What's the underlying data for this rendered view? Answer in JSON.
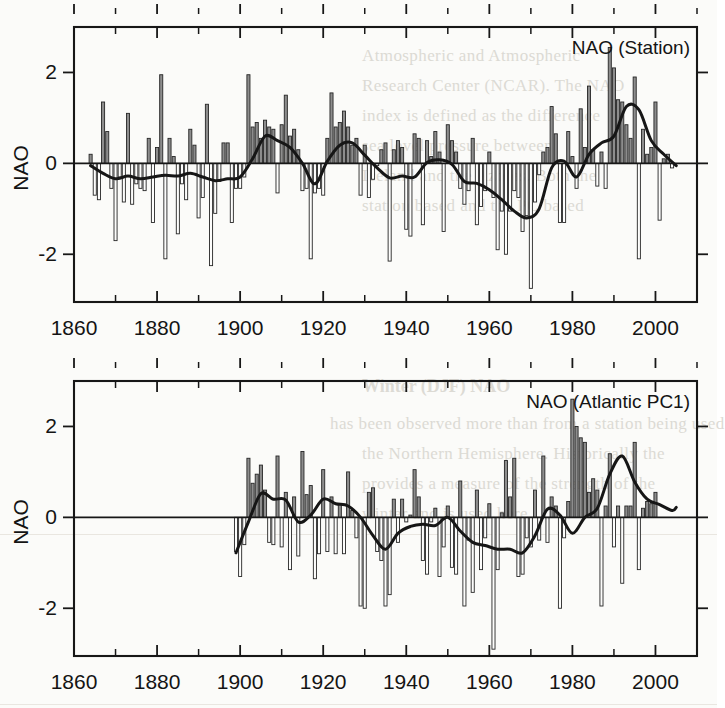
{
  "figure": {
    "background": "#fbfbf9",
    "ink_color": "#171717",
    "bar_positive_fill": "#8d8d8d",
    "bar_negative_fill": "#ffffff",
    "smooth_line_color": "#161616"
  },
  "bleed_text": {
    "note": "faint show-through text from the reverse side of the printed page",
    "top_lines": [
      "Atmospheric  and  Atmospheric",
      "Research  Center  (NCAR).  The  NAO",
      "index  is  defined  as  the  difference",
      "sea  level  pressure  between",
      "Iceland  and  the  Azores.  Both  the",
      "station  based  and  the  PC  based"
    ],
    "section_heading": "Winter  (DJF)  NAO",
    "bottom_lines": [
      "has  been  observed  more  than  from  a  station  being  used",
      "the  Northern  Hemisphere.  Historically  the",
      "provides  a  measure  of  the  strength  of  the",
      "winter  and  is  used  here"
    ]
  },
  "chart_data": [
    {
      "id": "nao-station",
      "type": "bar",
      "title": "NAO (Station)",
      "xlabel": "",
      "ylabel": "NAO",
      "xlim": [
        1860,
        2010
      ],
      "ylim": [
        -3.05,
        3.0
      ],
      "grid": false,
      "legend": null,
      "x_major_ticks": [
        1860,
        1880,
        1900,
        1920,
        1940,
        1960,
        1980,
        2000
      ],
      "x_major_tick_labels": [
        "1860",
        "1880",
        "1900",
        "1920",
        "1940",
        "1960",
        "1980",
        "2000"
      ],
      "x_minor_tick_interval": 10,
      "y_major_ticks": [
        -2,
        0,
        2
      ],
      "y_major_tick_labels": [
        "-2",
        "0",
        "2"
      ],
      "overlay_series_name": "low-pass filtered NAO",
      "x": [
        1864,
        1865,
        1866,
        1867,
        1868,
        1869,
        1870,
        1871,
        1872,
        1873,
        1874,
        1875,
        1876,
        1877,
        1878,
        1879,
        1880,
        1881,
        1882,
        1883,
        1884,
        1885,
        1886,
        1887,
        1888,
        1889,
        1890,
        1891,
        1892,
        1893,
        1894,
        1895,
        1896,
        1897,
        1898,
        1899,
        1900,
        1901,
        1902,
        1903,
        1904,
        1905,
        1906,
        1907,
        1908,
        1909,
        1910,
        1911,
        1912,
        1913,
        1914,
        1915,
        1916,
        1917,
        1918,
        1919,
        1920,
        1921,
        1922,
        1923,
        1924,
        1925,
        1926,
        1927,
        1928,
        1929,
        1930,
        1931,
        1932,
        1933,
        1934,
        1935,
        1936,
        1937,
        1938,
        1939,
        1940,
        1941,
        1942,
        1943,
        1944,
        1945,
        1946,
        1947,
        1948,
        1949,
        1950,
        1951,
        1952,
        1953,
        1954,
        1955,
        1956,
        1957,
        1958,
        1959,
        1960,
        1961,
        1962,
        1963,
        1964,
        1965,
        1966,
        1967,
        1968,
        1969,
        1970,
        1971,
        1972,
        1973,
        1974,
        1975,
        1976,
        1977,
        1978,
        1979,
        1980,
        1981,
        1982,
        1983,
        1984,
        1985,
        1986,
        1987,
        1988,
        1989,
        1990,
        1991,
        1992,
        1993,
        1994,
        1995,
        1996,
        1997,
        1998,
        1999,
        2000,
        2001,
        2002,
        2003,
        2004,
        2005
      ],
      "values": [
        0.2,
        -0.7,
        -0.8,
        1.35,
        0.7,
        -0.55,
        -1.7,
        -0.3,
        -0.85,
        1.1,
        -0.9,
        -0.45,
        -0.55,
        -0.6,
        0.55,
        -1.3,
        0.35,
        1.95,
        -2.1,
        0.55,
        0.15,
        -1.55,
        -0.45,
        -0.8,
        0.75,
        0.4,
        -1.2,
        -0.75,
        1.3,
        -2.25,
        -1.1,
        -0.4,
        0.45,
        0.45,
        -1.3,
        -0.55,
        -0.55,
        -0.3,
        1.95,
        0.8,
        0.9,
        0.55,
        0.95,
        0.8,
        0.75,
        -0.65,
        0.85,
        1.5,
        0.6,
        0.75,
        0.3,
        -0.6,
        -0.55,
        -2.1,
        -0.65,
        -0.55,
        -0.7,
        0.55,
        1.55,
        0.8,
        0.9,
        1.15,
        0.8,
        0.4,
        0.55,
        -0.7,
        0.4,
        -0.75,
        -0.35,
        -0.05,
        0.3,
        0.45,
        -2.15,
        0.3,
        0.5,
        0.35,
        -1.45,
        -1.6,
        0.65,
        0.55,
        -1.35,
        0.5,
        0.15,
        0.7,
        0.25,
        -1.5,
        0.85,
        0.5,
        0.25,
        -0.55,
        -0.9,
        -0.6,
        0.55,
        -1.35,
        -0.95,
        -0.6,
        0.25,
        -0.75,
        -1.9,
        -1.05,
        -2.0,
        -1.05,
        -0.6,
        -0.75,
        -1.5,
        -1.15,
        -2.75,
        -0.85,
        -0.25,
        0.25,
        0.35,
        1.25,
        0.65,
        -1.3,
        -1.3,
        0.7,
        0.15,
        -0.55,
        1.2,
        0.35,
        1.7,
        0.3,
        -0.5,
        0.25,
        -0.55,
        2.55,
        2.1,
        1.4,
        1.35,
        0.85,
        0.55,
        1.9,
        -2.1,
        0.75,
        0.2,
        0.35,
        1.35,
        -1.25,
        0.1,
        0.2,
        -0.1
      ],
      "smooth_x": [
        1864,
        1867,
        1870,
        1873,
        1876,
        1879,
        1882,
        1885,
        1888,
        1891,
        1894,
        1897,
        1900,
        1903,
        1906,
        1909,
        1912,
        1915,
        1918,
        1921,
        1924,
        1927,
        1930,
        1933,
        1936,
        1939,
        1942,
        1945,
        1948,
        1951,
        1954,
        1957,
        1960,
        1963,
        1966,
        1969,
        1972,
        1975,
        1978,
        1981,
        1984,
        1987,
        1990,
        1993,
        1996,
        1999,
        2002,
        2005
      ],
      "smooth_y": [
        -0.05,
        -0.22,
        -0.34,
        -0.28,
        -0.34,
        -0.3,
        -0.26,
        -0.28,
        -0.22,
        -0.3,
        -0.38,
        -0.34,
        -0.3,
        0.1,
        0.6,
        0.5,
        0.35,
        0.0,
        -0.45,
        0.05,
        0.4,
        0.45,
        0.18,
        -0.1,
        -0.32,
        -0.28,
        -0.3,
        0.02,
        0.08,
        -0.02,
        -0.4,
        -0.44,
        -0.58,
        -0.8,
        -1.05,
        -1.2,
        -1.0,
        -0.1,
        0.05,
        -0.3,
        0.2,
        0.45,
        0.6,
        1.25,
        1.18,
        0.5,
        0.2,
        -0.05
      ]
    },
    {
      "id": "nao-atlantic-pc1",
      "type": "bar",
      "title": "NAO (Atlantic PC1)",
      "xlabel": "",
      "ylabel": "NAO",
      "xlim": [
        1860,
        2010
      ],
      "ylim": [
        -3.05,
        3.0
      ],
      "grid": false,
      "legend": null,
      "x_major_ticks": [
        1860,
        1880,
        1900,
        1920,
        1940,
        1960,
        1980,
        2000
      ],
      "x_major_tick_labels": [
        "1860",
        "1880",
        "1900",
        "1920",
        "1940",
        "1960",
        "1980",
        "2000"
      ],
      "x_minor_tick_interval": 10,
      "y_major_ticks": [
        -2,
        0,
        2
      ],
      "y_major_tick_labels": [
        "-2",
        "0",
        "2"
      ],
      "overlay_series_name": "low-pass filtered NAO",
      "x": [
        1899,
        1900,
        1901,
        1902,
        1903,
        1904,
        1905,
        1906,
        1907,
        1908,
        1909,
        1910,
        1911,
        1912,
        1913,
        1914,
        1915,
        1916,
        1917,
        1918,
        1919,
        1920,
        1921,
        1922,
        1923,
        1924,
        1925,
        1926,
        1927,
        1928,
        1929,
        1930,
        1931,
        1932,
        1933,
        1934,
        1935,
        1936,
        1937,
        1938,
        1939,
        1940,
        1941,
        1942,
        1943,
        1944,
        1945,
        1946,
        1947,
        1948,
        1949,
        1950,
        1951,
        1952,
        1953,
        1954,
        1955,
        1956,
        1957,
        1958,
        1959,
        1960,
        1961,
        1962,
        1963,
        1964,
        1965,
        1966,
        1967,
        1968,
        1969,
        1970,
        1971,
        1972,
        1973,
        1974,
        1975,
        1976,
        1977,
        1978,
        1979,
        1980,
        1981,
        1982,
        1983,
        1984,
        1985,
        1986,
        1987,
        1988,
        1989,
        1990,
        1991,
        1992,
        1993,
        1994,
        1995,
        1996,
        1997,
        1998,
        1999,
        2000,
        2001,
        2002,
        2003,
        2004,
        2005
      ],
      "values": [
        -0.75,
        -1.3,
        -0.6,
        1.3,
        0.75,
        0.95,
        1.15,
        0.6,
        -0.55,
        -0.6,
        1.35,
        -0.65,
        0.55,
        -1.15,
        0.45,
        -0.85,
        1.45,
        0.5,
        0.7,
        -1.35,
        -0.8,
        1.05,
        -0.75,
        0.45,
        -0.8,
        0.3,
        -0.8,
        1.0,
        0.15,
        -0.45,
        -1.95,
        -2.0,
        0.55,
        0.65,
        -0.75,
        -0.95,
        -1.95,
        -1.7,
        0.4,
        -0.55,
        0.4,
        -0.1,
        0.05,
        1.05,
        0.45,
        -0.95,
        -1.25,
        -0.1,
        0.2,
        -1.3,
        -0.65,
        0.25,
        -1.1,
        -1.25,
        0.8,
        -1.95,
        -0.5,
        -1.65,
        0.6,
        -1.15,
        -0.45,
        0.3,
        -2.9,
        -1.15,
        0.1,
        1.25,
        0.45,
        1.3,
        -1.3,
        -1.25,
        -0.45,
        -0.65,
        0.6,
        -0.5,
        1.35,
        -0.55,
        0.45,
        0.25,
        -2.0,
        -0.45,
        0.35,
        2.6,
        2.0,
        1.75,
        1.65,
        0.55,
        0.85,
        0.6,
        -1.95,
        0.25,
        1.4,
        -0.65,
        0.25,
        -1.45,
        0.25,
        0.25,
        1.65,
        -1.15,
        0.2,
        0.35,
        0.3,
        0.55
      ],
      "smooth_x": [
        1899,
        1902,
        1905,
        1908,
        1911,
        1914,
        1917,
        1920,
        1923,
        1926,
        1929,
        1932,
        1935,
        1938,
        1941,
        1944,
        1947,
        1950,
        1953,
        1956,
        1959,
        1962,
        1965,
        1968,
        1971,
        1974,
        1977,
        1980,
        1983,
        1986,
        1989,
        1992,
        1995,
        1998,
        2001,
        2004,
        2005
      ],
      "smooth_y": [
        -0.78,
        -0.1,
        0.52,
        0.4,
        0.38,
        -0.1,
        0.05,
        0.4,
        0.3,
        0.25,
        0.0,
        -0.4,
        -0.7,
        -0.35,
        -0.2,
        -0.15,
        -0.18,
        0.0,
        -0.3,
        -0.55,
        -0.62,
        -0.7,
        -0.7,
        -0.78,
        -0.4,
        0.18,
        0.05,
        -0.35,
        0.0,
        0.2,
        0.95,
        1.35,
        0.78,
        0.4,
        0.28,
        0.15,
        0.22
      ]
    }
  ]
}
